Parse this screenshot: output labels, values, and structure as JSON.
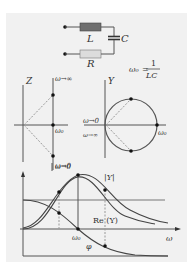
{
  "circuit": {
    "inductor_label": "L",
    "capacitor_label": "C",
    "resistor_label": "R",
    "inductor_color": "#6f6f6f",
    "resistor_color": "#dcdcdc"
  },
  "formula": {
    "lhs": "ω₀",
    "equals": "=",
    "numerator": "1",
    "denominator": "LC"
  },
  "impedance_plot": {
    "axis_label": "Z",
    "label_top": "ω→∞",
    "label_mid": "ω₀",
    "label_bottom": "ω→0"
  },
  "admittance_plot": {
    "axis_label": "Y",
    "label_omega_zero": "ω→0",
    "label_omega_inf": "ω→∞",
    "label_omega0": "ω₀"
  },
  "frequency_plot": {
    "label_omega_to_zero": "ω→0",
    "label_abs_y": "|Y|",
    "label_re_y": "Re (Y)",
    "label_omega0": "ω₀",
    "label_phi": "φ",
    "label_omega_axis": "ω"
  },
  "colors": {
    "panel_bg": "#f1f1f1",
    "line": "#555555",
    "dashed": "#999999",
    "curve": "#444444",
    "dot": "#111111"
  }
}
